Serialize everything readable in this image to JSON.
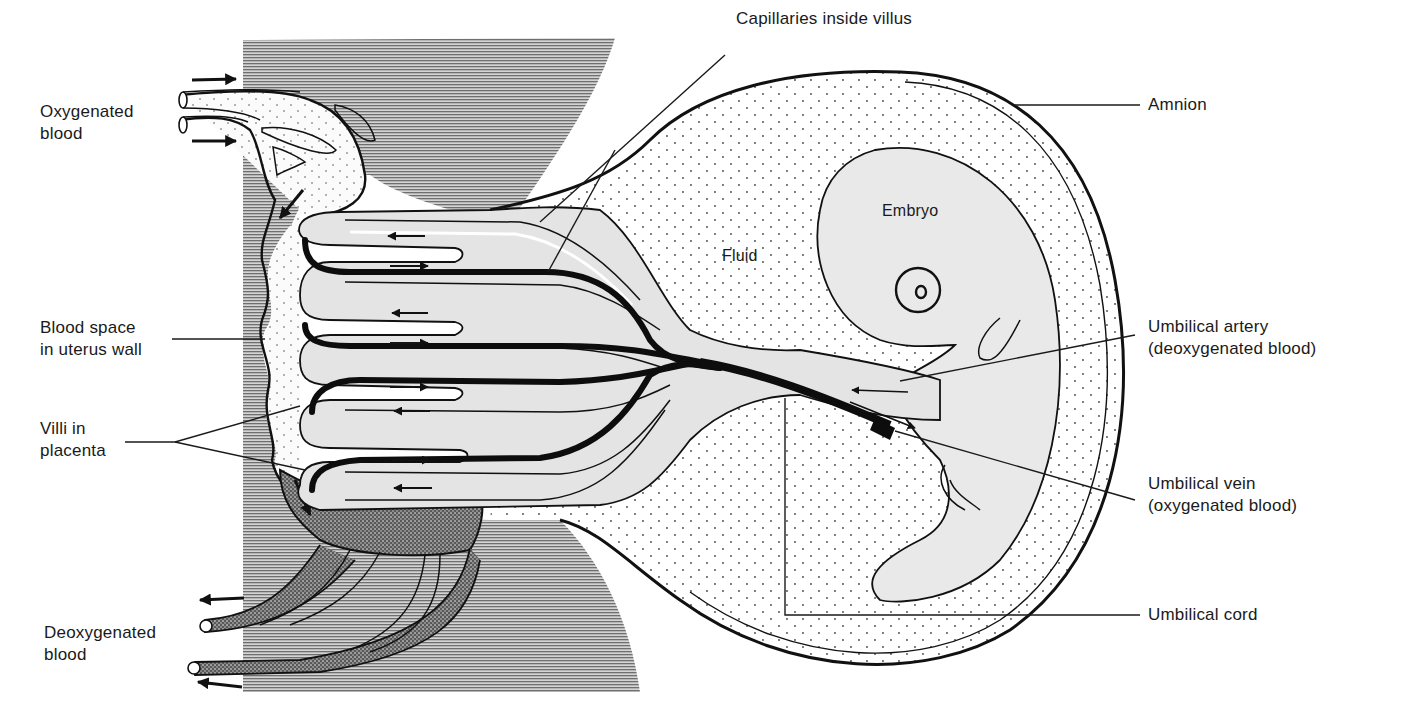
{
  "diagram": {
    "labels": {
      "oxygenated_blood": "Oxygenated\nblood",
      "blood_space": "Blood space\nin uterus wall",
      "villi": "Villi in\nplacenta",
      "deoxygenated_blood": "Deoxygenated\nblood",
      "capillaries": "Capillaries inside villus",
      "amnion": "Amnion",
      "embryo": "Embryo",
      "fluid": "Fluid",
      "umbilical_artery": "Umbilical artery\n(deoxygenated blood)",
      "umbilical_vein": "Umbilical vein\n(oxygenated blood)",
      "umbilical_cord": "Umbilical cord"
    },
    "colors": {
      "uterus_wall_hatch": "#9a9a9a",
      "tissue_fill": "#e6e6e6",
      "fluid_fill": "#ffffff",
      "line": "#111111",
      "stipple_dense": "#3a3a3a"
    }
  }
}
